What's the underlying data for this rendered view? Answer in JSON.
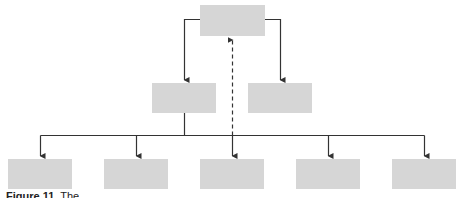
{
  "diagram": {
    "type": "hierarchy-chart",
    "colors": {
      "box_fill": "#d6d6d6",
      "line": "#333333",
      "background": "#ffffff"
    },
    "nodes": [
      {
        "id": "top",
        "level": 0,
        "label": ""
      },
      {
        "id": "mid-left",
        "level": 1,
        "label": ""
      },
      {
        "id": "mid-right",
        "level": 1,
        "label": ""
      },
      {
        "id": "bottom-1",
        "level": 2,
        "label": ""
      },
      {
        "id": "bottom-2",
        "level": 2,
        "label": ""
      },
      {
        "id": "bottom-3",
        "level": 2,
        "label": ""
      },
      {
        "id": "bottom-4",
        "level": 2,
        "label": ""
      },
      {
        "id": "bottom-5",
        "level": 2,
        "label": ""
      }
    ],
    "edges": [
      {
        "from": "top",
        "to": "mid-left",
        "style": "solid"
      },
      {
        "from": "top",
        "to": "mid-right",
        "style": "solid"
      },
      {
        "from": "mid-left",
        "to": "bottom-1",
        "style": "solid"
      },
      {
        "from": "mid-left",
        "to": "bottom-2",
        "style": "solid"
      },
      {
        "from": "mid-left",
        "to": "bottom-3",
        "style": "solid"
      },
      {
        "from": "mid-left",
        "to": "bottom-4",
        "style": "solid"
      },
      {
        "from": "mid-left",
        "to": "bottom-5",
        "style": "solid"
      },
      {
        "from": "bottom-bus",
        "to": "top",
        "style": "dashed"
      }
    ]
  },
  "caption": {
    "label": "Figure 11.",
    "text": "The"
  }
}
